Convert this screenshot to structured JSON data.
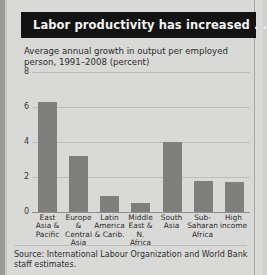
{
  "banner": {
    "title": "Labor productivity has increased . . ."
  },
  "subtitle": "Average annual growth in output per employed person, 1991–2008 (percent)",
  "source": "Source: International Labour Organization and World Bank staff estimates.",
  "colors": {
    "banner_bg": "#131313",
    "banner_text": "#f2f2f0",
    "bar": "#7f7f7d",
    "page_bg": "#d9d9d7",
    "gridline": "#bdbdbb"
  },
  "chart_data": {
    "type": "bar",
    "title": "Labor productivity has increased . . .",
    "subtitle": "Average annual growth in output per employed person, 1991–2008 (percent)",
    "xlabel": "",
    "ylabel": "",
    "ylim": [
      0,
      8
    ],
    "yticks": [
      0,
      2,
      4,
      6,
      8
    ],
    "ytick_labels": [
      "0",
      "2",
      "4",
      "6",
      "8"
    ],
    "grid": true,
    "legend": false,
    "categories": [
      "East\nAsia &\nPacific",
      "Europe &\nCentral\nAsia",
      "Latin\nAmerica\n& Carib.",
      "Middle\nEast &\nN. Africa",
      "South\nAsia",
      "Sub-\nSaharan\nAfrica",
      "High\nincome"
    ],
    "category_names": [
      "East Asia & Pacific",
      "Europe & Central Asia",
      "Latin America & Carib.",
      "Middle East & N. Africa",
      "South Asia",
      "Sub-Saharan Africa",
      "High income"
    ],
    "values": [
      6.3,
      3.2,
      0.9,
      0.5,
      4.0,
      1.8,
      1.7
    ]
  }
}
